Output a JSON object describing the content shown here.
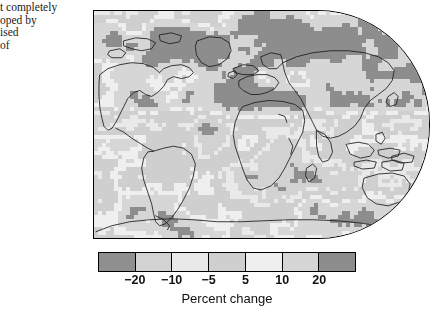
{
  "caption_fragment": {
    "name": "clipped-caption-text",
    "lines": [
      "t completely",
      "oped by",
      "ised",
      "of"
    ]
  },
  "figure": {
    "kind": "world-map-choropleth",
    "projection": "robinson"
  },
  "chart_data": {
    "type": "heatmap",
    "title": "",
    "subtitle": "",
    "xlabel": "",
    "ylabel": "",
    "colorbar_label": "Percent change",
    "grid": false,
    "legend_position": "bottom",
    "projection": "robinson",
    "map_extent": {
      "lon_min": -180,
      "lon_max": 180,
      "lat_min": -90,
      "lat_max": 90
    },
    "colorbar": {
      "orientation": "horizontal",
      "n_classes": 7,
      "boundaries": [
        -20,
        -10,
        -5,
        5,
        10,
        20
      ],
      "tick_labels": [
        "−20",
        "−10",
        "−5",
        "5",
        "10",
        "20"
      ],
      "class_ranges": [
        "< -20",
        "-20 to -10",
        "-10 to -5",
        "-5 to 5",
        "5 to 10",
        "10 to 20",
        "> 20"
      ],
      "class_colors": [
        "#8f8f8f",
        "#d2d2d2",
        "#e9e9e9",
        "#cfcfcf",
        "#efefef",
        "#d6d6d6",
        "#8d8d8d"
      ],
      "border_color": "#000000"
    },
    "units": "percent",
    "annotations": []
  },
  "colors": {
    "page_background": "#ffffff",
    "map_outline": "#000000",
    "coastline": "#1b1b1b",
    "text": "#111111"
  }
}
